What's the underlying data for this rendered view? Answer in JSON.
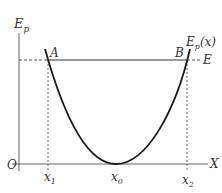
{
  "diagram": {
    "type": "potential-energy-well",
    "axes": {
      "y_label": "E",
      "y_label_sub": "p",
      "x_label": "X",
      "origin_label": "O"
    },
    "curve_label": "E",
    "curve_label_sub": "p",
    "curve_label_arg": "(x)",
    "energy_level_label": "E",
    "points": {
      "A": "A",
      "B": "B"
    },
    "x_ticks": {
      "x1": "x",
      "x1_sub": "1",
      "x0": "x",
      "x0_sub": "0",
      "x2": "x",
      "x2_sub": "2"
    },
    "colors": {
      "curve": "#1a1a1a",
      "axes": "#555555",
      "dashed": "#555555",
      "text": "#333333"
    }
  }
}
